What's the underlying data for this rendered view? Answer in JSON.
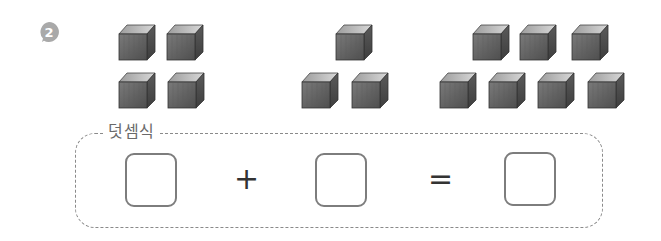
{
  "problem": {
    "number": "2",
    "badge_color": "#a9a9a9"
  },
  "groups": [
    {
      "name": "group-1",
      "count": 4,
      "rows": [
        2,
        2
      ]
    },
    {
      "name": "group-2",
      "count": 3,
      "rows": [
        1,
        2
      ]
    },
    {
      "name": "group-3",
      "count": 7,
      "rows": [
        3,
        4
      ]
    }
  ],
  "equation": {
    "label": "덧셈식",
    "operator_plus": "+",
    "operator_equals": "=",
    "blanks": [
      "",
      "",
      ""
    ]
  }
}
